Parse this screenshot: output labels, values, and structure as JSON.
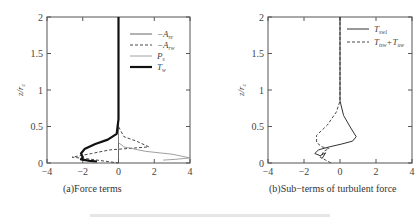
{
  "figure": {
    "bottom_caption_visible": "faint, cut-off figure caption (illegible)"
  },
  "chart_data": [
    {
      "type": "line",
      "panel": "a",
      "caption": "(a)Force terms",
      "xlabel": "",
      "ylabel": "z/r_c",
      "ylabel_display": "z/r",
      "ylabel_sub": "c",
      "xlim": [
        -4,
        4
      ],
      "ylim": [
        0,
        2
      ],
      "xticks": [
        "-4",
        "-2",
        "0",
        "2",
        "4"
      ],
      "yticks": [
        "0",
        "0.5",
        "1",
        "1.5",
        "2"
      ],
      "grid": false,
      "legend_position": "upper right",
      "legend": [
        {
          "label": "−A",
          "sub": "re",
          "style": "thin-solid"
        },
        {
          "label": "−A",
          "sub": "rw",
          "style": "dashed"
        },
        {
          "label": "P",
          "sub": "s",
          "style": "thin-solid-gray"
        },
        {
          "label": "T",
          "sub": "w",
          "style": "thick-solid"
        }
      ],
      "series": [
        {
          "name": "-A_re",
          "x": [
            0,
            0,
            0,
            0,
            0,
            0
          ],
          "y": [
            2,
            1.5,
            1,
            0.5,
            0.2,
            0
          ]
        },
        {
          "name": "-A_rw",
          "x": [
            0,
            0,
            0.3,
            1.0,
            1.7,
            -0.5,
            -1.5,
            -2.6,
            -1.8,
            -1.2,
            0
          ],
          "y": [
            2,
            0.5,
            0.36,
            0.3,
            0.22,
            0.18,
            0.13,
            0.08,
            0.06,
            0.04,
            0.0
          ]
        },
        {
          "name": "P_s",
          "x": [
            0,
            0,
            0.3,
            1.5,
            3.0,
            4.0,
            3.2,
            2.5
          ],
          "y": [
            2,
            0.28,
            0.22,
            0.16,
            0.12,
            0.07,
            0.05,
            0.04
          ]
        },
        {
          "name": "T_w",
          "x": [
            0,
            0,
            -0.1,
            -0.6,
            -1.3,
            -1.9,
            -2.1,
            -2.0,
            -2.1,
            -1.6,
            -1.2
          ],
          "y": [
            2,
            0.6,
            0.4,
            0.32,
            0.26,
            0.19,
            0.13,
            0.08,
            0.05,
            0.03,
            0.02
          ]
        }
      ]
    },
    {
      "type": "line",
      "panel": "b",
      "caption": "(b)Sub−terms of turbulent force",
      "xlabel": "",
      "ylabel": "z/r_c",
      "ylabel_display": "z/r",
      "ylabel_sub": "c",
      "xlim": [
        -4,
        4
      ],
      "ylim": [
        0,
        2
      ],
      "xticks": [
        "-4",
        "-2",
        "0",
        "2",
        "4"
      ],
      "yticks": [
        "0",
        "0.5",
        "1",
        "1.5",
        "2"
      ],
      "grid": false,
      "legend_position": "upper right",
      "legend": [
        {
          "label": "T",
          "sub": "sw1",
          "style": "solid"
        },
        {
          "label": "T",
          "sub": "tsw",
          "extra": "+T",
          "extra_sub": "uw",
          "style": "dashed"
        }
      ],
      "series": [
        {
          "name": "T_sw1",
          "x": [
            0,
            0,
            0.2,
            0.6,
            0.9,
            0.7,
            0.1,
            -0.6,
            -1.2,
            -1.4,
            -1.1,
            -0.8,
            -1.0
          ],
          "y": [
            2,
            0.85,
            0.65,
            0.48,
            0.36,
            0.3,
            0.26,
            0.22,
            0.18,
            0.13,
            0.1,
            0.14,
            0.06
          ]
        },
        {
          "name": "T_tsw+T_uw",
          "x": [
            0,
            0,
            -0.2,
            -0.7,
            -1.3,
            -1.3,
            -1.0,
            -0.6,
            -0.9,
            -1.1,
            -0.8,
            -0.5
          ],
          "y": [
            2,
            0.85,
            0.7,
            0.52,
            0.38,
            0.28,
            0.22,
            0.2,
            0.16,
            0.08,
            0.04,
            0.0
          ]
        }
      ]
    }
  ]
}
